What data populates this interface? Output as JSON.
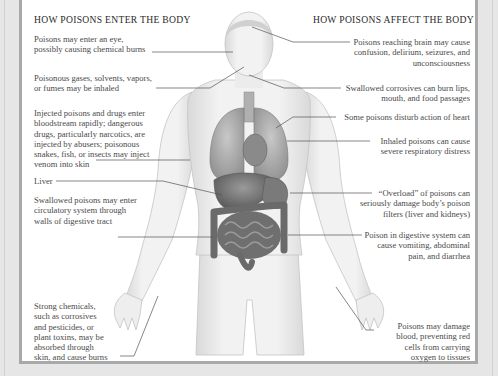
{
  "headings": {
    "left": "HOW POISONS ENTER THE BODY",
    "right": "HOW POISONS AFFECT THE BODY"
  },
  "left_labels": [
    {
      "id": "eye",
      "text": "Poisons may enter an eye,\npossibly causing chemical burns"
    },
    {
      "id": "inhaled",
      "text": "Poisonous gases, solvents, vapors,\nor fumes may be inhaled"
    },
    {
      "id": "injected",
      "text": "Injected poisons and drugs enter\nbloodstream rapidly; dangerous\ndrugs, particularly narcotics, are\ninjected by abusers; poisonous\nsnakes, fish, or insects may inject\nvenom into skin"
    },
    {
      "id": "liver",
      "text": "Liver"
    },
    {
      "id": "swallowed",
      "text": "Swallowed poisons may enter\ncirculatory system through\nwalls of digestive tract"
    },
    {
      "id": "skin",
      "text": "Strong chemicals,\nsuch as corrosives\nand pesticides, or\nplant toxins, may be\nabsorbed through\nskin, and cause burns"
    }
  ],
  "right_labels": [
    {
      "id": "brain",
      "text": "Poisons reaching brain may cause\nconfusion, delirium, seizures, and\nunconsciousness"
    },
    {
      "id": "corrosives",
      "text": "Swallowed corrosives can burn lips,\nmouth, and food passages"
    },
    {
      "id": "heart",
      "text": "Some poisons disturb action of heart"
    },
    {
      "id": "respiratory",
      "text": "Inhaled poisons can cause\nsevere respiratory distress"
    },
    {
      "id": "overload",
      "text": "“Overload” of poisons can\nseriously damage body’s poison\nfilters (liver and kidneys)"
    },
    {
      "id": "digestive",
      "text": "Poison in digestive system can\ncause vomiting, abdominal\npain, and diarrhea"
    },
    {
      "id": "blood",
      "text": "Poisons may damage\nblood, preventing red\ncells from carrying\noxygen to tissues"
    }
  ],
  "colors": {
    "background": "#e6e6e6",
    "panel": "#ffffff",
    "border": "#a9a9a9",
    "leader_line": "#555555",
    "skin": "#eeeeee",
    "organs": "#6e6e6e"
  }
}
